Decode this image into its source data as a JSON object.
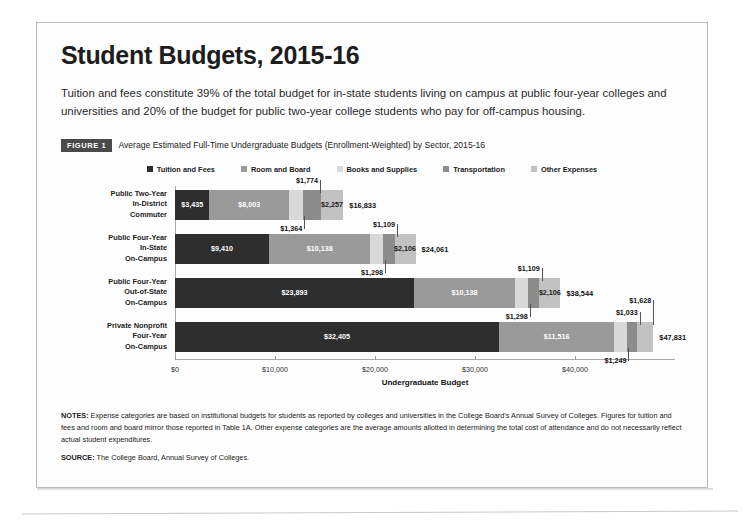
{
  "title": "Student Budgets, 2015-16",
  "intro": "Tuition and fees constitute 39% of the total budget for in-state students living on campus at public four-year colleges and universities and 20% of the budget for public two-year college students who pay for off-campus housing.",
  "figure": {
    "badge": "FIGURE 1",
    "caption": "Average Estimated Full-Time Undergraduate Budgets (Enrollment-Weighted) by Sector, 2015-16"
  },
  "notes": {
    "notes_label": "NOTES:",
    "notes_text": "Expense categories are based on institutional budgets for students as reported by colleges and universities in the College Board's Annual Survey of Colleges. Figures for tuition and fees and room and board mirror those reported in Table 1A. Other expense categories are the average amounts allotted in determining the total cost of attendance and do not necessarily reflect actual student expenditures.",
    "source_label": "SOURCE:",
    "source_text": "The College Board, Annual Survey of Colleges."
  },
  "colors": {
    "tuition": "#2e2e2e",
    "room_board": "#9a9a9a",
    "books": "#d9d9d9",
    "transportation": "#8c8c8c",
    "other": "#c2c2c2",
    "axis": "#aaaaaa",
    "badge_bg": "#4a4a4a",
    "page_border": "#b9b9b9"
  },
  "chart_data": {
    "type": "bar",
    "orientation": "horizontal",
    "stacked": true,
    "title": "Average Estimated Full-Time Undergraduate Budgets (Enrollment-Weighted) by Sector, 2015-16",
    "xlabel": "Undergraduate Budget",
    "ylabel": "",
    "xlim": [
      0,
      50000
    ],
    "xticks": [
      0,
      10000,
      20000,
      30000,
      40000
    ],
    "xticklabels": [
      "$0",
      "$10,000",
      "$20,000",
      "$30,000",
      "$40,000"
    ],
    "grid": false,
    "legend_position": "top-center",
    "categories": [
      "Public Two-Year In-District Commuter",
      "Public Four-Year In-State On-Campus",
      "Public Four-Year Out-of-State On-Campus",
      "Private Nonprofit Four-Year On-Campus"
    ],
    "category_lines": [
      [
        "Public Two-Year",
        "In-District",
        "Commuter"
      ],
      [
        "Public Four-Year",
        "In-State",
        "On-Campus"
      ],
      [
        "Public Four-Year",
        "Out-of-State",
        "On-Campus"
      ],
      [
        "Private Nonprofit",
        "Four-Year",
        "On-Campus"
      ]
    ],
    "series": [
      {
        "name": "Tuition and Fees",
        "color": "#2e2e2e",
        "values": [
          3435,
          9410,
          23893,
          32405
        ]
      },
      {
        "name": "Room and Board",
        "color": "#9a9a9a",
        "values": [
          8003,
          10138,
          10138,
          11516
        ]
      },
      {
        "name": "Books and Supplies",
        "color": "#d9d9d9",
        "values": [
          1364,
          1298,
          1298,
          1249
        ]
      },
      {
        "name": "Transportation",
        "color": "#8c8c8c",
        "values": [
          1774,
          1109,
          1109,
          1033
        ]
      },
      {
        "name": "Other Expenses",
        "color": "#c2c2c2",
        "values": [
          2257,
          2106,
          2106,
          1628
        ]
      }
    ],
    "totals": [
      16833,
      24061,
      38544,
      47831
    ],
    "total_labels": [
      "$16,833",
      "$24,061",
      "$38,544",
      "$47,831"
    ],
    "bars": [
      {
        "category": "Public Two-Year In-District Commuter",
        "total_label": "$16,833",
        "segments": [
          {
            "series": "Tuition and Fees",
            "value": 3435,
            "label": "$3,435",
            "label_placement": "inside",
            "label_color": "light"
          },
          {
            "series": "Room and Board",
            "value": 8003,
            "label": "$8,003",
            "label_placement": "inside",
            "label_color": "light"
          },
          {
            "series": "Books and Supplies",
            "value": 1364,
            "label": "$1,364",
            "label_placement": "below"
          },
          {
            "series": "Transportation",
            "value": 1774,
            "label": "$1,774",
            "label_placement": "above"
          },
          {
            "series": "Other Expenses",
            "value": 2257,
            "label": "$2,257",
            "label_placement": "inside",
            "label_color": "dark"
          }
        ]
      },
      {
        "category": "Public Four-Year In-State On-Campus",
        "total_label": "$24,061",
        "segments": [
          {
            "series": "Tuition and Fees",
            "value": 9410,
            "label": "$9,410",
            "label_placement": "inside",
            "label_color": "light"
          },
          {
            "series": "Room and Board",
            "value": 10138,
            "label": "$10,138",
            "label_placement": "inside",
            "label_color": "light"
          },
          {
            "series": "Books and Supplies",
            "value": 1298,
            "label": "$1,298",
            "label_placement": "below"
          },
          {
            "series": "Transportation",
            "value": 1109,
            "label": "$1,109",
            "label_placement": "above"
          },
          {
            "series": "Other Expenses",
            "value": 2106,
            "label": "$2,106",
            "label_placement": "inside",
            "label_color": "dark"
          }
        ]
      },
      {
        "category": "Public Four-Year Out-of-State On-Campus",
        "total_label": "$38,544",
        "segments": [
          {
            "series": "Tuition and Fees",
            "value": 23893,
            "label": "$23,893",
            "label_placement": "inside",
            "label_color": "light"
          },
          {
            "series": "Room and Board",
            "value": 10138,
            "label": "$10,138",
            "label_placement": "inside",
            "label_color": "light"
          },
          {
            "series": "Books and Supplies",
            "value": 1298,
            "label": "$1,298",
            "label_placement": "below"
          },
          {
            "series": "Transportation",
            "value": 1109,
            "label": "$1,109",
            "label_placement": "above"
          },
          {
            "series": "Other Expenses",
            "value": 2106,
            "label": "$2,106",
            "label_placement": "inside",
            "label_color": "dark"
          }
        ]
      },
      {
        "category": "Private Nonprofit Four-Year On-Campus",
        "total_label": "$47,831",
        "segments": [
          {
            "series": "Tuition and Fees",
            "value": 32405,
            "label": "$32,405",
            "label_placement": "inside",
            "label_color": "light"
          },
          {
            "series": "Room and Board",
            "value": 11516,
            "label": "$11,516",
            "label_placement": "inside",
            "label_color": "light"
          },
          {
            "series": "Books and Supplies",
            "value": 1249,
            "label": "$1,249",
            "label_placement": "below"
          },
          {
            "series": "Transportation",
            "value": 1033,
            "label": "$1,033",
            "label_placement": "above"
          },
          {
            "series": "Other Expenses",
            "value": 1628,
            "label": "$1,628",
            "label_placement": "above2"
          }
        ]
      }
    ]
  }
}
